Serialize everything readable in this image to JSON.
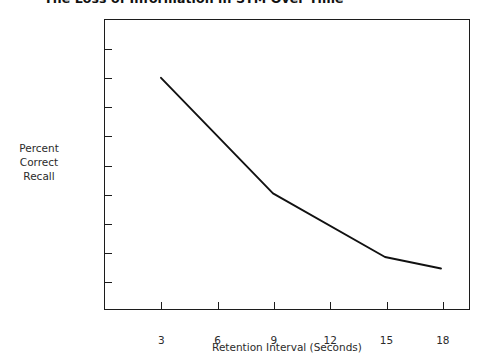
{
  "figure": {
    "title": "The Loss of Information in STM Over Time"
  },
  "axes": {
    "y_title_lines": [
      "Percent",
      "Correct",
      "Recall"
    ],
    "x_title": "Retention Interval (Seconds)",
    "y_ticks": [
      "0",
      "10",
      "20",
      "30",
      "40",
      "50",
      "60",
      "70",
      "80",
      "90",
      "100"
    ],
    "x_ticks": [
      "3",
      "6",
      "9",
      "12",
      "15",
      "18"
    ]
  },
  "style": {
    "line_color": "#111111",
    "frame_color": "#1c1c1c",
    "background": "#ffffff"
  },
  "chart_data": {
    "type": "line",
    "title": "The Loss of Information in STM Over Time",
    "xlabel": "Retention Interval (Seconds)",
    "ylabel": "Percent Correct Recall",
    "x": [
      3,
      9,
      15,
      18
    ],
    "values": [
      80,
      40,
      18,
      14
    ],
    "series": [
      {
        "name": "Percent Correct Recall",
        "points": [
          {
            "x": 3,
            "y": 80
          },
          {
            "x": 9,
            "y": 40
          },
          {
            "x": 15,
            "y": 18
          },
          {
            "x": 18,
            "y": 14
          }
        ]
      }
    ],
    "xlim": [
      0,
      19.5
    ],
    "ylim": [
      0,
      100
    ],
    "x_ticks": [
      3,
      6,
      9,
      12,
      15,
      18
    ],
    "y_ticks": [
      0,
      10,
      20,
      30,
      40,
      50,
      60,
      70,
      80,
      90,
      100
    ],
    "grid": false,
    "legend": "none",
    "markers": false
  }
}
